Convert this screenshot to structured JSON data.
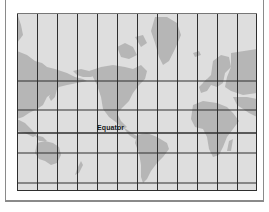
{
  "figure": {
    "projection": "Mercator",
    "labels": {
      "equator": "Equator"
    },
    "grid": {
      "columns": 12,
      "vertical_lines_x": [
        0,
        20,
        40,
        60,
        80,
        100,
        120,
        140,
        160,
        180,
        200,
        220,
        240
      ],
      "horizontal_lines_y": [
        0,
        68,
        97,
        120,
        140,
        170,
        177
      ]
    },
    "colors": {
      "ocean": "#dedede",
      "land": "#b6b6b6",
      "grid": "#2e2e2e",
      "frame": "#8a8a8a"
    }
  }
}
